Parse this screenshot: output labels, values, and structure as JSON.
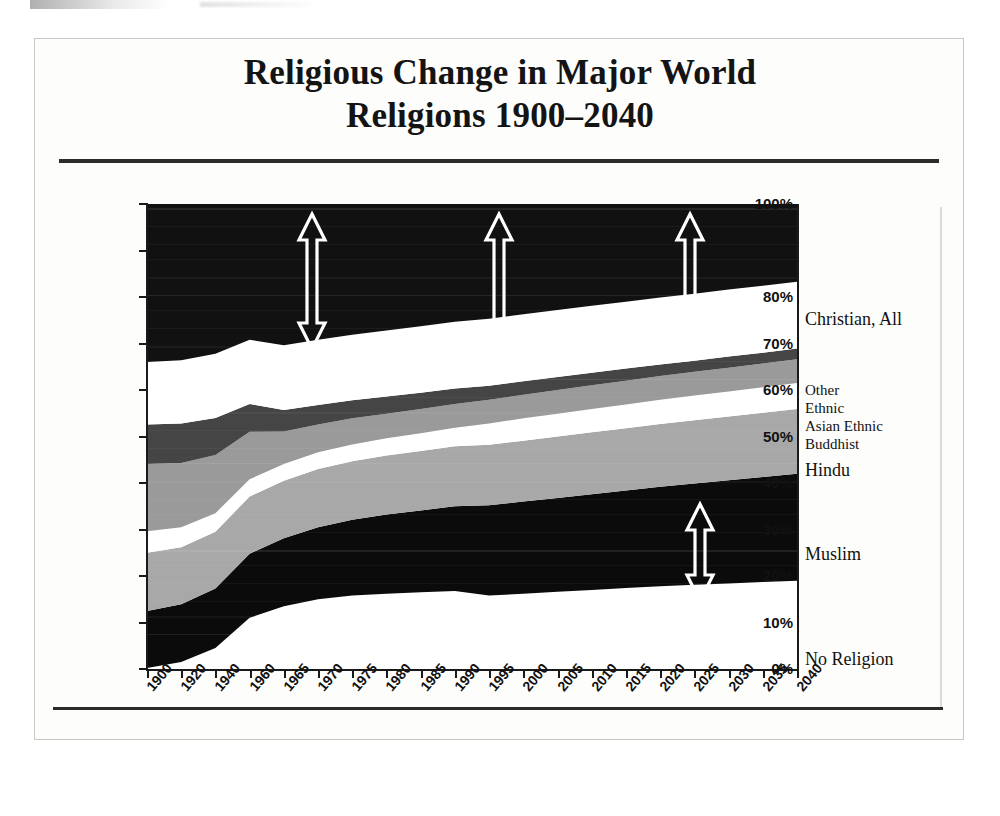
{
  "figure": {
    "title_line1": "Religious Change in Major World",
    "title_line2": "Religions 1900–2040"
  },
  "axes": {
    "y_ticks": [
      "100%",
      "90%",
      "80%",
      "70%",
      "60%",
      "50%",
      "40%",
      "30%",
      "20%",
      "10%",
      "0%"
    ],
    "x_ticks": [
      "1900",
      "1920",
      "1940",
      "1960",
      "1965",
      "1970",
      "1975",
      "1980",
      "1985",
      "1990",
      "1995",
      "2000",
      "2005",
      "2010",
      "2015",
      "2020",
      "2025",
      "2030",
      "2035",
      "2040"
    ]
  },
  "legend": {
    "items": [
      {
        "label": "Christian, All",
        "top": 105,
        "size": "normal"
      },
      {
        "label": "Other",
        "top": 178,
        "size": "small"
      },
      {
        "label": "Ethnic",
        "top": 196,
        "size": "small"
      },
      {
        "label": "Asian Ethnic",
        "top": 214,
        "size": "small"
      },
      {
        "label": "Buddhist",
        "top": 232,
        "size": "small"
      },
      {
        "label": "Hindu",
        "top": 256,
        "size": "normal"
      },
      {
        "label": "Muslim",
        "top": 340,
        "size": "normal"
      },
      {
        "label": "No Religion",
        "top": 445,
        "size": "normal"
      }
    ]
  },
  "annotations": {
    "arrows": [
      {
        "name": "christian-span-arrow-1965",
        "x": 165,
        "y_top": 10,
        "y_bottom": 145
      },
      {
        "name": "christian-span-arrow-1995",
        "x": 352,
        "y_top": 10,
        "y_bottom": 145
      },
      {
        "name": "christian-span-arrow-2025",
        "x": 543,
        "y_top": 10,
        "y_bottom": 145
      },
      {
        "name": "muslim-span-arrow-2025",
        "x": 553,
        "y_top": 300,
        "y_bottom": 397
      }
    ]
  },
  "chart_data": {
    "type": "area",
    "title": "Religious Change in Major World Religions 1900–2040",
    "xlabel": "",
    "ylabel": "",
    "ylim": [
      0,
      100
    ],
    "grid": false,
    "stacked": true,
    "legend_position": "right",
    "x": [
      "1900",
      "1920",
      "1940",
      "1960",
      "1965",
      "1970",
      "1975",
      "1980",
      "1985",
      "1990",
      "1995",
      "2000",
      "2005",
      "2010",
      "2015",
      "2020",
      "2025",
      "2030",
      "2035",
      "2040"
    ],
    "series": [
      {
        "name": "No Religion",
        "color": "#ffffff",
        "values": [
          0.2,
          1.5,
          4.5,
          11.0,
          13.5,
          15.0,
          15.8,
          16.2,
          16.5,
          16.8,
          15.8,
          16.2,
          16.6,
          17.0,
          17.4,
          17.8,
          18.1,
          18.4,
          18.7,
          19.0
        ]
      },
      {
        "name": "Muslim",
        "color": "#0b0b0b",
        "values": [
          12.3,
          12.4,
          12.8,
          13.8,
          14.6,
          15.5,
          16.3,
          17.0,
          17.6,
          18.2,
          19.4,
          19.8,
          20.2,
          20.6,
          21.0,
          21.4,
          21.8,
          22.2,
          22.6,
          23.0
        ]
      },
      {
        "name": "Hindu",
        "color": "#a8a8a8",
        "values": [
          12.5,
          12.3,
          12.2,
          12.3,
          12.4,
          12.5,
          12.6,
          12.7,
          12.8,
          12.9,
          13.0,
          13.1,
          13.2,
          13.3,
          13.4,
          13.5,
          13.6,
          13.7,
          13.8,
          13.9
        ]
      },
      {
        "name": "Buddhist",
        "color": "#ffffff",
        "values": [
          4.6,
          4.3,
          4.0,
          3.7,
          3.6,
          3.6,
          3.6,
          3.7,
          3.8,
          4.0,
          4.6,
          4.8,
          4.9,
          5.0,
          5.1,
          5.2,
          5.3,
          5.4,
          5.5,
          5.6
        ]
      },
      {
        "name": "Asian Ethnic",
        "color": "#9a9a9a",
        "values": [
          14.5,
          13.8,
          12.5,
          10.2,
          7.0,
          6.0,
          5.6,
          5.3,
          5.2,
          5.1,
          5.1,
          5.1,
          5.1,
          5.1,
          5.1,
          5.1,
          5.1,
          5.1,
          5.1,
          5.1
        ]
      },
      {
        "name": "Ethnic",
        "color": "#454545",
        "values": [
          8.5,
          8.5,
          8.0,
          6.0,
          4.6,
          4.2,
          3.9,
          3.7,
          3.5,
          3.3,
          3.0,
          2.9,
          2.8,
          2.7,
          2.6,
          2.5,
          2.4,
          2.4,
          2.3,
          2.3
        ]
      },
      {
        "name": "Other",
        "color": "#ffffff",
        "values": [
          13.4,
          13.6,
          13.8,
          13.8,
          13.9,
          14.0,
          14.1,
          14.2,
          14.3,
          14.4,
          14.4,
          14.4,
          14.4,
          14.4,
          14.4,
          14.4,
          14.4,
          14.4,
          14.4,
          14.4
        ]
      },
      {
        "name": "Christian, All",
        "color": "#111111",
        "values": [
          34.0,
          33.6,
          32.2,
          29.2,
          30.4,
          29.2,
          28.1,
          27.2,
          26.3,
          25.3,
          24.7,
          23.7,
          22.8,
          21.9,
          21.0,
          20.1,
          19.3,
          18.4,
          17.6,
          16.7
        ]
      }
    ]
  }
}
